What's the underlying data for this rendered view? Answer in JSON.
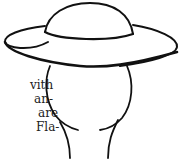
{
  "text_fragments": {
    "lines": [
      {
        "text": "vith",
        "x": 30,
        "y": 78
      },
      {
        "text": "an-",
        "x": 34,
        "y": 92
      },
      {
        "text": "are",
        "x": 38,
        "y": 106
      },
      {
        "text": "Fla-",
        "x": 36,
        "y": 120
      }
    ]
  },
  "illustration": {
    "subject": "wide-brimmed hat on head outline",
    "stroke_color": "#111111"
  }
}
